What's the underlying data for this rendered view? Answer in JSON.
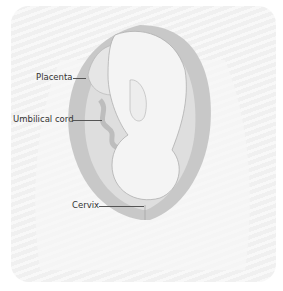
{
  "diagram": {
    "type": "anatomical-illustration",
    "labels": [
      {
        "id": "placenta",
        "text": "Placenta"
      },
      {
        "id": "umbilical-cord",
        "text": "Umbilical cord"
      },
      {
        "id": "cervix",
        "text": "Cervix"
      }
    ],
    "colors": {
      "background": "#f0f0f0",
      "uterine_wall": "#c8c8c8",
      "fetus": "#f4f4f4",
      "outline": "#9a9a9a",
      "label_text": "#333333",
      "leader_line": "#555555"
    }
  }
}
